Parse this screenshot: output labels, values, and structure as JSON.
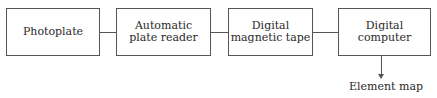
{
  "diagram": {
    "type": "flowchart",
    "nodes": [
      {
        "id": "photoplate",
        "lines": [
          "Photoplate"
        ]
      },
      {
        "id": "plate-reader",
        "lines": [
          "Automatic",
          "plate reader"
        ]
      },
      {
        "id": "magnetic-tape",
        "lines": [
          "Digital",
          "magnetic tape"
        ]
      },
      {
        "id": "computer",
        "lines": [
          "Digital",
          "computer"
        ]
      }
    ],
    "output": {
      "label": "Element map"
    },
    "edges": [
      [
        "photoplate",
        "plate-reader"
      ],
      [
        "plate-reader",
        "magnetic-tape"
      ],
      [
        "magnetic-tape",
        "computer"
      ],
      [
        "computer",
        "Element map"
      ]
    ]
  }
}
